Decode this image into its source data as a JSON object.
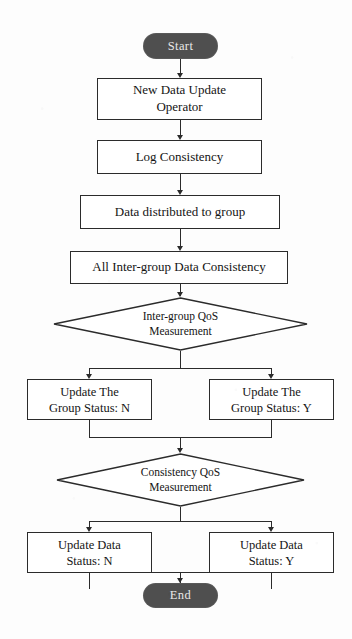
{
  "diagram": {
    "type": "flowchart",
    "orientation": "top-to-bottom",
    "colors": {
      "terminator_fill": "#4f4f4f",
      "terminator_text": "#e9e9e9",
      "stroke": "#2b2b2b",
      "node_fill": "#ffffff",
      "background": "#fdfdfd"
    },
    "nodes": {
      "start": {
        "label": "Start",
        "shape": "terminator"
      },
      "new_data_update_operator": {
        "line1": "New Data Update",
        "line2": "Operator",
        "shape": "process"
      },
      "log_consistency": {
        "label": "Log Consistency",
        "shape": "process"
      },
      "data_distributed_to_group": {
        "label": "Data distributed to group",
        "shape": "process"
      },
      "all_inter_group_data_consistency": {
        "label": "All  Inter-group Data Consistency",
        "shape": "process"
      },
      "inter_group_qos_measurement": {
        "line1": "Inter-group QoS",
        "line2": "Measurement",
        "shape": "decision"
      },
      "update_group_status_n": {
        "line1": "Update The",
        "line2": "Group Status: N",
        "shape": "process"
      },
      "update_group_status_y": {
        "line1": "Update The",
        "line2": "Group Status: Y",
        "shape": "process"
      },
      "consistency_qos_measurement": {
        "line1": "Consistency QoS",
        "line2": "Measurement",
        "shape": "decision"
      },
      "update_data_status_n": {
        "line1": "Update Data",
        "line2": "Status: N",
        "shape": "process"
      },
      "update_data_status_y": {
        "line1": "Update Data",
        "line2": "Status: Y",
        "shape": "process"
      },
      "end": {
        "label": "End",
        "shape": "terminator"
      }
    },
    "caption_remnant": ""
  }
}
